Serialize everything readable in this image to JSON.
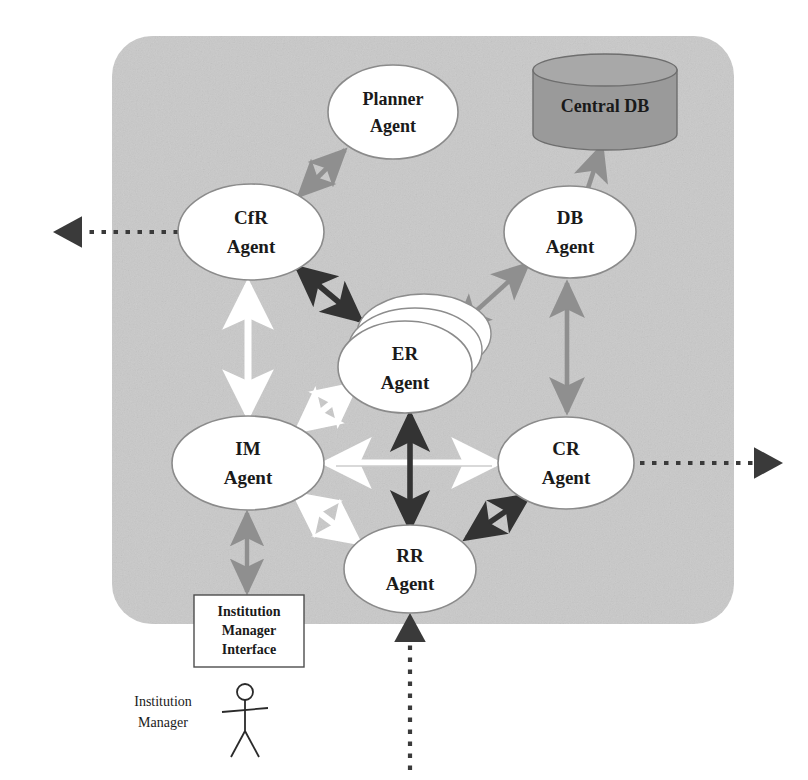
{
  "diagram": {
    "panel": {
      "name": "agent-platform-boundary",
      "fill": "#c9c9c9"
    },
    "nodes": [
      {
        "id": "planner",
        "label_line1": "Planner",
        "label_line2": "Agent",
        "shape": "ellipse",
        "cx": 393,
        "cy": 112,
        "rx": 65,
        "ry": 47
      },
      {
        "id": "central_db",
        "label_line1": "Central DB",
        "label_line2": "",
        "shape": "cylinder",
        "cx": 605,
        "cy": 102,
        "rx": 72,
        "ry": 16,
        "h": 68
      },
      {
        "id": "cfr",
        "label_line1": "CfR",
        "label_line2": "Agent",
        "shape": "ellipse",
        "cx": 251,
        "cy": 232,
        "rx": 73,
        "ry": 48
      },
      {
        "id": "db",
        "label_line1": "DB",
        "label_line2": "Agent",
        "shape": "ellipse",
        "cx": 570,
        "cy": 232,
        "rx": 66,
        "ry": 46
      },
      {
        "id": "er",
        "label_line1": "ER",
        "label_line2": "Agent",
        "shape": "stack",
        "cx": 405,
        "cy": 367,
        "rx": 67,
        "ry": 46
      },
      {
        "id": "im",
        "label_line1": "IM",
        "label_line2": "Agent",
        "shape": "ellipse",
        "cx": 248,
        "cy": 463,
        "rx": 76,
        "ry": 47
      },
      {
        "id": "cr",
        "label_line1": "CR",
        "label_line2": "Agent",
        "shape": "ellipse",
        "cx": 566,
        "cy": 463,
        "rx": 68,
        "ry": 46
      },
      {
        "id": "rr",
        "label_line1": "RR",
        "label_line2": "Agent",
        "shape": "ellipse",
        "cx": 410,
        "cy": 569,
        "rx": 66,
        "ry": 44
      }
    ],
    "interface_box": {
      "id": "im_interface",
      "line1": "Institution",
      "line2": "Manager",
      "line3": "Interface",
      "x": 194,
      "y": 595,
      "w": 110,
      "h": 72
    },
    "actor": {
      "id": "institution_manager",
      "label_line1": "Institution",
      "label_line2": "Manager",
      "x": 245,
      "y": 690
    },
    "connectors": [
      {
        "id": "cfr-planner",
        "from": "CfR Agent",
        "to": "Planner Agent",
        "style": "gray-double"
      },
      {
        "id": "db-centraldb",
        "from": "DB Agent",
        "to": "Central DB",
        "style": "gray-double"
      },
      {
        "id": "er-db",
        "from": "ER Agent",
        "to": "DB Agent",
        "style": "gray-double"
      },
      {
        "id": "db-cr",
        "from": "DB Agent",
        "to": "CR Agent",
        "style": "gray-double"
      },
      {
        "id": "cfr-er",
        "from": "CfR Agent",
        "to": "ER Agent",
        "style": "dark-double"
      },
      {
        "id": "cr-rr",
        "from": "CR Agent",
        "to": "RR Agent",
        "style": "dark-double"
      },
      {
        "id": "er-rr",
        "from": "ER Agent",
        "to": "RR Agent",
        "style": "dark-double"
      },
      {
        "id": "cfr-im",
        "from": "CfR Agent",
        "to": "IM Agent",
        "style": "white-double"
      },
      {
        "id": "im-er",
        "from": "IM Agent",
        "to": "ER Agent",
        "style": "white-double"
      },
      {
        "id": "im-rr",
        "from": "IM Agent",
        "to": "RR Agent",
        "style": "white-double"
      },
      {
        "id": "im-cr",
        "from": "IM Agent",
        "to": "CR Agent",
        "style": "white-double"
      },
      {
        "id": "im-interface",
        "from": "IM Agent",
        "to": "Institution Manager Interface",
        "style": "gray-double"
      },
      {
        "id": "cfr-external",
        "from": "CfR Agent",
        "to": "external (left)",
        "style": "dotted-single"
      },
      {
        "id": "cr-external",
        "from": "CR Agent",
        "to": "external (right)",
        "style": "dotted-single"
      },
      {
        "id": "rr-external",
        "from": "external (below)",
        "to": "RR Agent",
        "style": "dotted-single"
      }
    ],
    "colors": {
      "panel": "#c9c9c9",
      "gray_arrow": "#8f8f8f",
      "dark_arrow": "#333333",
      "white_arrow": "#ffffff",
      "dotted_arrow": "#3a3a3a",
      "node_fill": "#ffffff",
      "node_stroke": "#8b8b8b",
      "db_fill": "#9a9a9a",
      "text": "#1a1a1a"
    }
  }
}
